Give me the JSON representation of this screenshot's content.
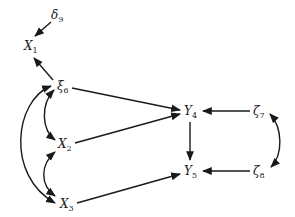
{
  "diagram": {
    "type": "path-diagram",
    "nodes": [
      {
        "id": "delta9",
        "symbol": "δ",
        "subscript": "9"
      },
      {
        "id": "X1",
        "symbol": "X",
        "subscript": "1"
      },
      {
        "id": "xi6",
        "symbol": "ξ",
        "subscript": "6"
      },
      {
        "id": "X2",
        "symbol": "X",
        "subscript": "2"
      },
      {
        "id": "X3",
        "symbol": "X",
        "subscript": "3"
      },
      {
        "id": "Y4",
        "symbol": "Y",
        "subscript": "4"
      },
      {
        "id": "Y5",
        "symbol": "Y",
        "subscript": "5"
      },
      {
        "id": "zeta7",
        "symbol": "ζ",
        "subscript": "7"
      },
      {
        "id": "zeta8",
        "symbol": "ζ",
        "subscript": "8"
      }
    ],
    "edges": [
      {
        "from": "delta9",
        "to": "X1",
        "type": "directed"
      },
      {
        "from": "xi6",
        "to": "X1",
        "type": "directed"
      },
      {
        "from": "xi6",
        "to": "Y4",
        "type": "directed"
      },
      {
        "from": "X2",
        "to": "Y4",
        "type": "directed"
      },
      {
        "from": "X3",
        "to": "Y5",
        "type": "directed"
      },
      {
        "from": "Y4",
        "to": "Y5",
        "type": "directed"
      },
      {
        "from": "zeta7",
        "to": "Y4",
        "type": "directed"
      },
      {
        "from": "zeta8",
        "to": "Y5",
        "type": "directed"
      },
      {
        "from": "xi6",
        "to": "X2",
        "type": "bidirected"
      },
      {
        "from": "xi6",
        "to": "X3",
        "type": "bidirected"
      },
      {
        "from": "X2",
        "to": "X3",
        "type": "bidirected"
      },
      {
        "from": "zeta7",
        "to": "zeta8",
        "type": "bidirected"
      }
    ],
    "colors": {
      "ink": "#1a1a1a",
      "background": "#ffffff"
    }
  }
}
